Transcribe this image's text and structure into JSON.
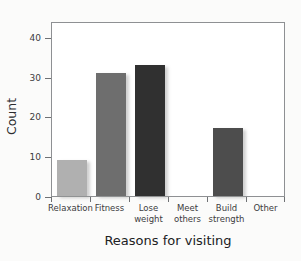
{
  "chart_data": {
    "type": "bar",
    "title": "",
    "xlabel": "Reasons for visiting",
    "ylabel": "Count",
    "categories": [
      "Relaxation",
      "Fitness",
      "Lose weight",
      "Meet others",
      "Build strength",
      "Other"
    ],
    "values": [
      9,
      31,
      33,
      0,
      17,
      0
    ],
    "bar_colors": [
      "#b0b0b0",
      "#6e6e6e",
      "#303030",
      "#ffffff",
      "#4d4d4d",
      "#ffffff"
    ],
    "ylim": [
      0,
      44
    ],
    "yticks": [
      0,
      10,
      20,
      30,
      40
    ],
    "ytick_labels": [
      "0",
      "10",
      "20",
      "30",
      "40"
    ],
    "grid": false,
    "legend": null,
    "axis_color": "#8e9093",
    "plot_background": "#ffffff",
    "figure_background": "#fbfbfa"
  },
  "axes": {
    "y_title": "Count",
    "x_title": "Reasons for visiting"
  }
}
